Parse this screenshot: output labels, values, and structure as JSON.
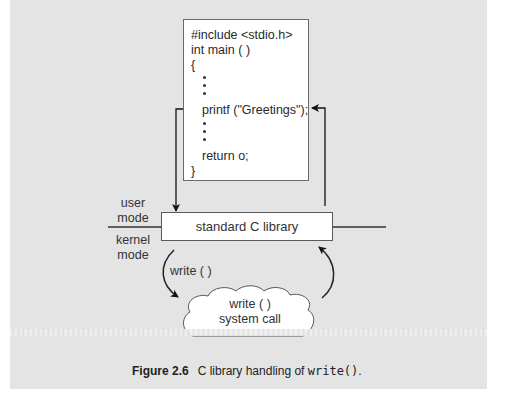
{
  "figure": {
    "number": "Figure 2.6",
    "caption_prefix": "C library handling of ",
    "caption_code": "write()",
    "caption_suffix": "."
  },
  "code_box": {
    "lines": [
      "#include <stdio.h>",
      "int main ( )",
      "{",
      "printf (\"Greetings\");",
      "return o;",
      "}"
    ]
  },
  "library_box": {
    "label": "standard C library"
  },
  "modes": {
    "user": [
      "user",
      "mode"
    ],
    "kernel": [
      "kernel",
      "mode"
    ]
  },
  "call_arrow": {
    "label": "write ( )"
  },
  "system_call_cloud": {
    "lines": [
      "write ( )",
      "system call"
    ]
  },
  "colors": {
    "panel_background": "#e4e4e4",
    "box_fill": "#ffffff",
    "line_color": "#222222"
  }
}
